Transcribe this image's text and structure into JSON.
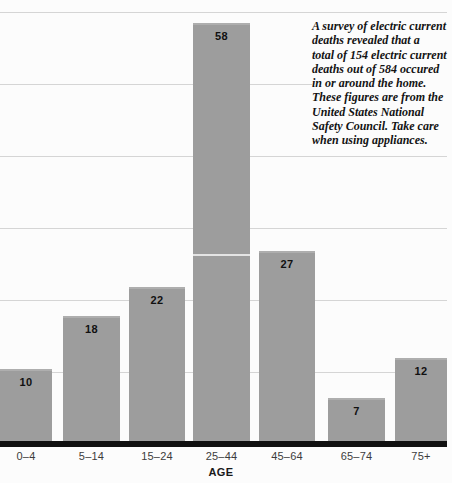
{
  "chart_data": {
    "type": "bar",
    "title": "",
    "categories": [
      "0–4",
      "5–14",
      "15–24",
      "25–44",
      "45–64",
      "65–74",
      "75+"
    ],
    "values": [
      10,
      18,
      22,
      58,
      27,
      7,
      12
    ],
    "xlabel": "AGE",
    "ylabel": "",
    "ylim": [
      0,
      62
    ],
    "gridline_values": [
      10,
      20,
      30,
      40,
      50,
      60
    ],
    "grid": "horizontal-light",
    "legend_position": "none",
    "value_labels_shown": true,
    "bar_color": "#9d9d9d",
    "gridline_color": "#d5d5d5",
    "axis_line_color": "#101010",
    "tick_label_color": "#3c3c3c"
  },
  "annotation": {
    "lines": [
      "A survey of electric current",
      "deaths revealed that a",
      "total of 154 electric current",
      "deaths out of 584 occured",
      "in or around the home.",
      "These figures are from the",
      "United States National",
      "Safety Council. Take care",
      "when using appliances."
    ]
  }
}
